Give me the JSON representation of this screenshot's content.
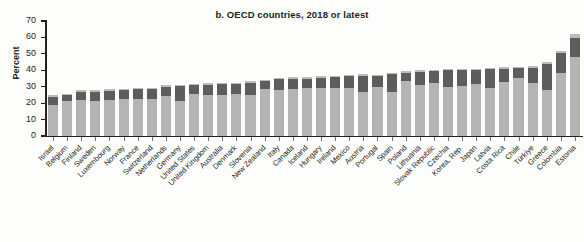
{
  "chart_data": {
    "type": "bar",
    "subtype": "stacked-bar",
    "title": "b. OECD countries, 2018 or latest",
    "xlabel": "",
    "ylabel": "Percent",
    "ylim": [
      0,
      70
    ],
    "yticks": [
      0,
      10,
      20,
      30,
      40,
      50,
      60,
      70
    ],
    "ytick_labels": [
      "0",
      "10",
      "20",
      "30",
      "40",
      "50",
      "60",
      "70"
    ],
    "grid": false,
    "legend": "none",
    "sorted": "ascending by total",
    "categories": [
      "Israel",
      "Belgium",
      "Finland",
      "Sweden",
      "Luxembourg",
      "Norway",
      "France",
      "Switzerland",
      "Netherlands",
      "Germany",
      "United States",
      "United Kingdom",
      "Australia",
      "Denmark",
      "Slovenia",
      "New Zealand",
      "Italy",
      "Canada",
      "Iceland",
      "Hungary",
      "Ireland",
      "Mexico",
      "Austria",
      "Portugal",
      "Spain",
      "Poland",
      "Lithuania",
      "Slovak Republic",
      "Czechia",
      "Korea, Rep.",
      "Japan",
      "Latvia",
      "Costa Rica",
      "Chile",
      "Türkiye",
      "Greece",
      "Colombia",
      "Estonia"
    ],
    "series": [
      {
        "name": "lower segment",
        "color": "#b4b4b4",
        "values": [
          19.0,
          21.5,
          22.0,
          21.5,
          22.0,
          22.5,
          22.5,
          22.5,
          24.5,
          21.5,
          25.5,
          25.0,
          25.0,
          25.5,
          25.0,
          28.5,
          28.0,
          28.5,
          29.0,
          29.5,
          29.0,
          29.0,
          26.5,
          30.0,
          27.0,
          33.5,
          31.0,
          32.0,
          30.0,
          30.5,
          31.5,
          29.5,
          33.0,
          35.5,
          32.5,
          28.0,
          38.5,
          48.0
        ]
      },
      {
        "name": "upper segment",
        "color": "#5d5d5d",
        "values": [
          5.0,
          3.5,
          5.0,
          5.5,
          5.5,
          5.5,
          6.0,
          6.0,
          5.5,
          9.0,
          5.5,
          6.0,
          6.5,
          6.0,
          7.5,
          5.0,
          6.5,
          6.5,
          6.0,
          6.0,
          7.0,
          7.5,
          10.0,
          6.5,
          10.5,
          5.0,
          8.0,
          7.5,
          10.0,
          9.5,
          8.5,
          11.0,
          8.0,
          6.0,
          9.0,
          16.0,
          12.0,
          11.5
        ]
      },
      {
        "name": "cap segment",
        "color": "#bcbcbc",
        "values": [
          0.8,
          0.8,
          1.0,
          0.8,
          1.0,
          0.8,
          0.8,
          1.0,
          0.8,
          0.8,
          0.8,
          1.0,
          0.8,
          1.0,
          1.0,
          0.8,
          1.0,
          0.8,
          0.8,
          0.8,
          0.8,
          0.8,
          1.0,
          0.8,
          1.0,
          0.8,
          1.0,
          0.8,
          1.0,
          0.8,
          1.0,
          0.8,
          1.0,
          0.8,
          1.0,
          1.0,
          1.5,
          2.5
        ]
      }
    ],
    "totals": [
      24.8,
      25.8,
      28.0,
      27.8,
      28.5,
      28.8,
      29.3,
      29.5,
      30.8,
      31.3,
      31.8,
      32.0,
      32.3,
      32.5,
      33.5,
      34.3,
      35.5,
      35.8,
      35.8,
      36.3,
      36.8,
      37.3,
      37.5,
      37.3,
      38.5,
      39.3,
      40.0,
      40.3,
      41.0,
      40.8,
      41.0,
      41.3,
      42.0,
      42.3,
      42.5,
      45.0,
      52.0,
      62.0
    ]
  }
}
